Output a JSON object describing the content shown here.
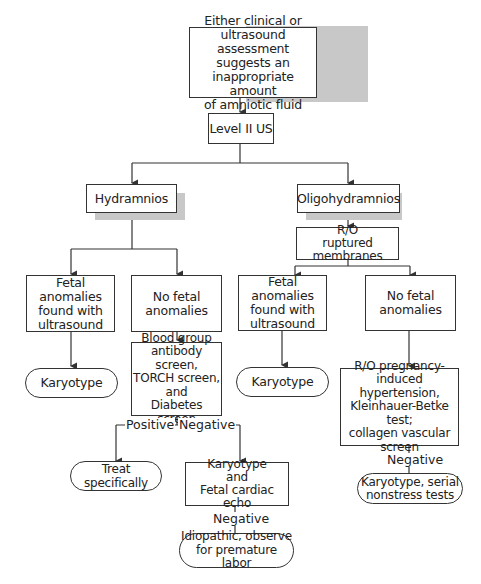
{
  "nodes": {
    "root": "Either clinical or\nultrasound assessment\nsuggests an\ninappropriate amount\nof amniotic fluid",
    "level2": "Level II US",
    "hydramnios": "Hydramnios",
    "oligohydramnios": "Oligohydramnios",
    "rupture": "R/O\nruptured membranes",
    "hydro_anomalies": "Fetal anomalies\nfound with\nultrasound",
    "hydro_no_anomalies": "No fetal\nanomalies",
    "oligo_anomalies": "Fetal anomalies\nfound with\nultrasound",
    "oligo_no_anomalies": "No fetal\nanomalies",
    "hydro_karyotype": "Karyotype",
    "oligo_karyotype": "Karyotype",
    "screens": "Blood group\nantibody screen,\nTORCH screen,\nand\nDiabetes screen",
    "ro_pih": "R/O pregnancy-\ninduced hypertension,\nKleinhauer-Betke test;\ncollagen vascular\nscreen",
    "treat": "Treat specifically",
    "karyo_echo": "Karyotype\nand\nFetal cardiac echo",
    "idiopathic": "Idiopathic, observe\nfor premature labor",
    "karyo_nst": "Karyotype, serial\nnonstress tests"
  },
  "labels": {
    "positive": "Positive",
    "negative_screens": "Negative",
    "negative_echo": "Negative",
    "negative_pih": "Negative"
  },
  "colors": {
    "line": "#333333",
    "shadow": "#c8c8c8",
    "background": "#ffffff"
  }
}
